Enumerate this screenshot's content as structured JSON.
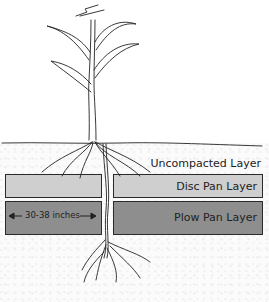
{
  "diagram": {
    "layers": [
      {
        "name": "Uncompacted Layer",
        "color": "#fbfbfb"
      },
      {
        "name": "Disc Pan Layer",
        "color": "#cfcfcf"
      },
      {
        "name": "Plow Pan Layer",
        "color": "#8e8e8e"
      }
    ],
    "measurement_label": "30-38 inches"
  }
}
